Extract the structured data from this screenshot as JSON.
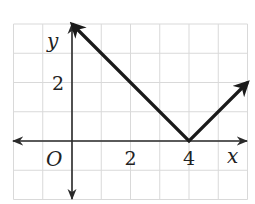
{
  "chart_data": {
    "type": "line",
    "title": "",
    "xlabel": "x",
    "ylabel": "y",
    "origin_label": "O",
    "xlim": [
      -2,
      6
    ],
    "ylim": [
      -2,
      4
    ],
    "grid": true,
    "x_tick_labels": [
      {
        "value": 2,
        "label": "2"
      },
      {
        "value": 4,
        "label": "4"
      }
    ],
    "y_tick_labels": [
      {
        "value": 2,
        "label": "2"
      }
    ],
    "series": [
      {
        "name": "absolute value graph",
        "points": [
          [
            0,
            4
          ],
          [
            4,
            0
          ],
          [
            6,
            2
          ]
        ],
        "arrow_start": true,
        "arrow_end": true,
        "color": "#1a1a1a"
      }
    ],
    "colors": {
      "grid": "#d9d9d9",
      "axis": "#2a2a2a",
      "line": "#1a1a1a"
    }
  }
}
